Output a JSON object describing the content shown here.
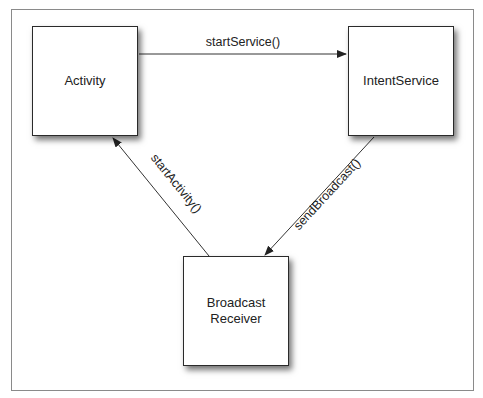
{
  "diagram": {
    "nodes": [
      {
        "id": "activity",
        "label": "Activity"
      },
      {
        "id": "intentservice",
        "label": "IntentService"
      },
      {
        "id": "broadcastreceiver",
        "label": "Broadcast\nReceiver"
      }
    ],
    "edges": [
      {
        "from": "activity",
        "to": "intentservice",
        "label": "startService()"
      },
      {
        "from": "intentservice",
        "to": "broadcastreceiver",
        "label": "sendBroadcast()"
      },
      {
        "from": "broadcastreceiver",
        "to": "activity",
        "label": "startActivity()"
      }
    ]
  }
}
